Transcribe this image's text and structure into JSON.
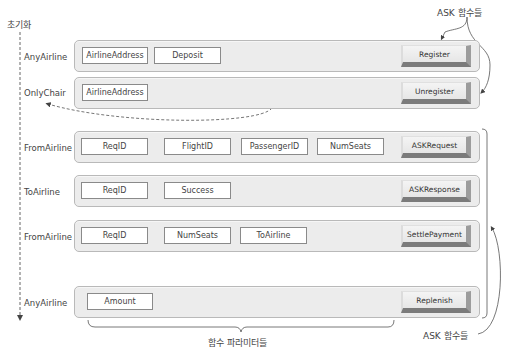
{
  "diagram": {
    "start_label": "초기화",
    "top_annotation": "ASK 함수들",
    "bottom_annotation": "ASK 함수들",
    "params_annotation": "함수 파라미터들",
    "rows": [
      {
        "caller": "AnyAirline",
        "params": [
          "AirlineAddress",
          "Deposit"
        ],
        "function": "Register"
      },
      {
        "caller": "OnlyChair",
        "params": [
          "AirlineAddress"
        ],
        "function": "Unregister"
      },
      {
        "caller": "FromAirline",
        "params": [
          "ReqID",
          "FlightID",
          "PassengerID",
          "NumSeats"
        ],
        "function": "ASKRequest"
      },
      {
        "caller": "ToAirline",
        "params": [
          "ReqID",
          "Success"
        ],
        "function": "ASKResponse"
      },
      {
        "caller": "FromAirline",
        "params": [
          "ReqID",
          "NumSeats",
          "ToAirline"
        ],
        "function": "SettlePayment"
      },
      {
        "caller": "AnyAirline",
        "params": [
          "Amount"
        ],
        "function": "Replenish"
      }
    ]
  },
  "colors": {
    "panel_bg": "#ececec",
    "panel_border": "#b9b9b9",
    "param_border": "#8a8a8a",
    "button_shadow": "#7b7b7b",
    "line": "#555555"
  }
}
